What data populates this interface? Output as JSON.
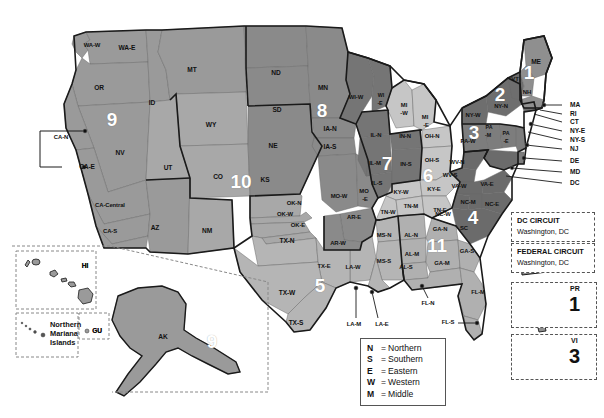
{
  "map": {
    "title": "United States Federal Judicial Circuits and District Courts",
    "background_color": "#ffffff",
    "outline_color": "#1a1a1a",
    "shades": {
      "circuit_1": "#8f8f8f",
      "circuit_2": "#6e6e6e",
      "circuit_3": "#7d7d7d",
      "circuit_4": "#6b6b6b",
      "circuit_5": "#b5b5b5",
      "circuit_6": "#c6c6c6",
      "circuit_7": "#757575",
      "circuit_8": "#8a8a8a",
      "circuit_9": "#9a9a9a",
      "circuit_10": "#a8a8a8",
      "circuit_11": "#b0b0b0"
    },
    "circuit_numbers": [
      {
        "label": "1",
        "x": 529,
        "y": 72
      },
      {
        "label": "2",
        "x": 500,
        "y": 94
      },
      {
        "label": "3",
        "x": 474,
        "y": 132
      },
      {
        "label": "4",
        "x": 473,
        "y": 217
      },
      {
        "label": "5",
        "x": 320,
        "y": 285
      },
      {
        "label": "6",
        "x": 428,
        "y": 175
      },
      {
        "label": "7",
        "x": 387,
        "y": 163
      },
      {
        "label": "8",
        "x": 322,
        "y": 110
      },
      {
        "label": "9",
        "x": 112,
        "y": 119
      },
      {
        "label": "9",
        "x": 212,
        "y": 341
      },
      {
        "label": "10",
        "x": 241,
        "y": 181
      },
      {
        "label": "11",
        "x": 437,
        "y": 245
      }
    ],
    "state_labels": [
      {
        "t": "WA-W",
        "x": 92,
        "y": 46,
        "c": "sm"
      },
      {
        "t": "WA-E",
        "x": 127,
        "y": 48,
        "c": ""
      },
      {
        "t": "OR",
        "x": 99,
        "y": 88,
        "c": ""
      },
      {
        "t": "ID",
        "x": 152,
        "y": 103,
        "c": ""
      },
      {
        "t": "MT",
        "x": 192,
        "y": 70,
        "c": ""
      },
      {
        "t": "WY",
        "x": 211,
        "y": 125,
        "c": ""
      },
      {
        "t": "NV",
        "x": 120,
        "y": 153,
        "c": ""
      },
      {
        "t": "UT",
        "x": 168,
        "y": 168,
        "c": ""
      },
      {
        "t": "CO",
        "x": 218,
        "y": 177,
        "c": ""
      },
      {
        "t": "AZ",
        "x": 155,
        "y": 228,
        "c": ""
      },
      {
        "t": "NM",
        "x": 207,
        "y": 231,
        "c": ""
      },
      {
        "t": "ND",
        "x": 276,
        "y": 73,
        "c": ""
      },
      {
        "t": "SD",
        "x": 277,
        "y": 110,
        "c": ""
      },
      {
        "t": "NE",
        "x": 273,
        "y": 146,
        "c": ""
      },
      {
        "t": "KS",
        "x": 265,
        "y": 180,
        "c": ""
      },
      {
        "t": "MN",
        "x": 323,
        "y": 88,
        "c": ""
      },
      {
        "t": "IA-N",
        "x": 330,
        "y": 129,
        "c": ""
      },
      {
        "t": "IA-S",
        "x": 330,
        "y": 147,
        "c": ""
      },
      {
        "t": "MO-W",
        "x": 339,
        "y": 197,
        "c": "sm"
      },
      {
        "t": "MO",
        "x": 364,
        "y": 192,
        "c": "sm"
      },
      {
        "t": "-E",
        "x": 365,
        "y": 200,
        "c": "sm"
      },
      {
        "t": "OK-N",
        "x": 294,
        "y": 204,
        "c": "sm"
      },
      {
        "t": "OK-W",
        "x": 285,
        "y": 215,
        "c": "sm"
      },
      {
        "t": "OK-E",
        "x": 298,
        "y": 226,
        "c": "sm"
      },
      {
        "t": "AR-E",
        "x": 354,
        "y": 218,
        "c": "sm"
      },
      {
        "t": "AR-W",
        "x": 338,
        "y": 244,
        "c": "sm"
      },
      {
        "t": "TX-N",
        "x": 287,
        "y": 241,
        "c": ""
      },
      {
        "t": "TX-E",
        "x": 324,
        "y": 267,
        "c": "sm"
      },
      {
        "t": "TX-W",
        "x": 287,
        "y": 293,
        "c": ""
      },
      {
        "t": "TX-S",
        "x": 296,
        "y": 323,
        "c": ""
      },
      {
        "t": "LA-W",
        "x": 353,
        "y": 268,
        "c": "sm"
      },
      {
        "t": "LA-M",
        "x": 354,
        "y": 325,
        "c": "sm"
      },
      {
        "t": "LA-E",
        "x": 382,
        "y": 325,
        "c": "sm"
      },
      {
        "t": "MS-N",
        "x": 384,
        "y": 236,
        "c": "sm"
      },
      {
        "t": "MS-S",
        "x": 384,
        "y": 262,
        "c": "sm"
      },
      {
        "t": "WI-W",
        "x": 356,
        "y": 98,
        "c": "sm"
      },
      {
        "t": "WI",
        "x": 381,
        "y": 96,
        "c": "xs"
      },
      {
        "t": "-E",
        "x": 380,
        "y": 104,
        "c": "xs"
      },
      {
        "t": "MI",
        "x": 404,
        "y": 106,
        "c": "sm"
      },
      {
        "t": "-W",
        "x": 404,
        "y": 114,
        "c": "sm"
      },
      {
        "t": "MI",
        "x": 425,
        "y": 118,
        "c": "sm"
      },
      {
        "t": "-E",
        "x": 426,
        "y": 126,
        "c": "sm"
      },
      {
        "t": "IL-N",
        "x": 376,
        "y": 136,
        "c": "sm"
      },
      {
        "t": "IL-M",
        "x": 375,
        "y": 164,
        "c": "sm"
      },
      {
        "t": "IL-S",
        "x": 377,
        "y": 184,
        "c": "sm"
      },
      {
        "t": "IN-N",
        "x": 405,
        "y": 137,
        "c": "sm"
      },
      {
        "t": "IN-S",
        "x": 406,
        "y": 165,
        "c": "sm"
      },
      {
        "t": "OH-N",
        "x": 432,
        "y": 137,
        "c": "sm"
      },
      {
        "t": "OH-S",
        "x": 432,
        "y": 161,
        "c": "sm"
      },
      {
        "t": "KY-W",
        "x": 401,
        "y": 193,
        "c": "sm"
      },
      {
        "t": "KY-E",
        "x": 434,
        "y": 190,
        "c": "sm"
      },
      {
        "t": "TN-M",
        "x": 411,
        "y": 207,
        "c": "sm"
      },
      {
        "t": "TN-W",
        "x": 388,
        "y": 213,
        "c": "sm"
      },
      {
        "t": "TN-E",
        "x": 440,
        "y": 211,
        "c": "sm"
      },
      {
        "t": "AL-N",
        "x": 411,
        "y": 236,
        "c": "sm"
      },
      {
        "t": "AL-M",
        "x": 412,
        "y": 255,
        "c": "sm"
      },
      {
        "t": "AL-S",
        "x": 406,
        "y": 268,
        "c": "sm"
      },
      {
        "t": "GA-N",
        "x": 440,
        "y": 230,
        "c": "sm"
      },
      {
        "t": "GA-M",
        "x": 442,
        "y": 264,
        "c": "sm"
      },
      {
        "t": "GA-S",
        "x": 467,
        "y": 252,
        "c": "sm"
      },
      {
        "t": "FL-N",
        "x": 428,
        "y": 304,
        "c": "sm"
      },
      {
        "t": "FL-M",
        "x": 478,
        "y": 293,
        "c": "sm"
      },
      {
        "t": "FL-S",
        "x": 448,
        "y": 323,
        "c": "sm"
      },
      {
        "t": "SC",
        "x": 464,
        "y": 229,
        "c": "sm"
      },
      {
        "t": "NC-W",
        "x": 443,
        "y": 215,
        "c": "sm"
      },
      {
        "t": "NC-M",
        "x": 468,
        "y": 203,
        "c": "sm"
      },
      {
        "t": "NC-E",
        "x": 492,
        "y": 205,
        "c": "sm"
      },
      {
        "t": "VA-W",
        "x": 459,
        "y": 187,
        "c": "sm"
      },
      {
        "t": "VA-E",
        "x": 487,
        "y": 185,
        "c": "sm"
      },
      {
        "t": "WV-N",
        "x": 457,
        "y": 163,
        "c": "sm"
      },
      {
        "t": "WV-S",
        "x": 450,
        "y": 176,
        "c": "sm"
      },
      {
        "t": "PA-W",
        "x": 468,
        "y": 142,
        "c": "sm"
      },
      {
        "t": "PA",
        "x": 489,
        "y": 128,
        "c": "xs"
      },
      {
        "t": "-M",
        "x": 488,
        "y": 136,
        "c": "xs"
      },
      {
        "t": "PA",
        "x": 506,
        "y": 134,
        "c": "xs"
      },
      {
        "t": "-E",
        "x": 506,
        "y": 142,
        "c": "xs"
      },
      {
        "t": "NY-W",
        "x": 473,
        "y": 116,
        "c": "sm"
      },
      {
        "t": "NY-N",
        "x": 501,
        "y": 107,
        "c": "sm"
      },
      {
        "t": "VT",
        "x": 515,
        "y": 80,
        "c": "sm"
      },
      {
        "t": "NH",
        "x": 527,
        "y": 93,
        "c": "sm"
      },
      {
        "t": "ME",
        "x": 536,
        "y": 62,
        "c": ""
      },
      {
        "t": "CA-N",
        "x": 61,
        "y": 138,
        "c": "sm"
      },
      {
        "t": "CA-E",
        "x": 87,
        "y": 167,
        "c": ""
      },
      {
        "t": "CA-Central",
        "x": 110,
        "y": 206,
        "c": "sm"
      },
      {
        "t": "CA-S",
        "x": 110,
        "y": 232,
        "c": "sm"
      },
      {
        "t": "AK",
        "x": 163,
        "y": 337,
        "c": ""
      },
      {
        "t": "HI",
        "x": 85,
        "y": 266,
        "c": ""
      },
      {
        "t": "GU",
        "x": 97,
        "y": 331,
        "c": ""
      }
    ],
    "coastal_labels": [
      {
        "t": "MA",
        "x": 570,
        "y": 105
      },
      {
        "t": "RI",
        "x": 570,
        "y": 114
      },
      {
        "t": "CT",
        "x": 570,
        "y": 122
      },
      {
        "t": "NY-E",
        "x": 570,
        "y": 131
      },
      {
        "t": "NY-S",
        "x": 570,
        "y": 140
      },
      {
        "t": "NJ",
        "x": 570,
        "y": 149
      },
      {
        "t": "DE",
        "x": 570,
        "y": 161
      },
      {
        "t": "MD",
        "x": 570,
        "y": 172
      },
      {
        "t": "DC",
        "x": 570,
        "y": 183
      }
    ],
    "insets": {
      "northern_mariana_islands": "Northern\nMariana\nIslands",
      "northern_mariana_line1": "Northern",
      "northern_mariana_line2": "Mariana",
      "northern_mariana_line3": "Islands",
      "guam": "GU",
      "hawaii": "HI"
    }
  },
  "legend": {
    "dc_circuit": {
      "title": "DC CIRCUIT",
      "location": "Washington, DC"
    },
    "federal_circuit": {
      "title": "FEDERAL CIRCUIT",
      "location": "Washington, DC"
    },
    "puerto_rico": {
      "abbr": "PR",
      "circuit": "1"
    },
    "virgin_islands": {
      "abbr": "VI",
      "circuit": "3"
    },
    "abbreviations": {
      "title": "",
      "rows": [
        {
          "key": "N",
          "eq": "=",
          "value": "Northern"
        },
        {
          "key": "S",
          "eq": "=",
          "value": "Southern"
        },
        {
          "key": "E",
          "eq": "=",
          "value": "Eastern"
        },
        {
          "key": "W",
          "eq": "=",
          "value": "Western"
        },
        {
          "key": "M",
          "eq": "=",
          "value": "Middle"
        }
      ]
    }
  },
  "chart_data": {
    "type": "map",
    "regions": [
      {
        "circuit": "1",
        "states": [
          "ME",
          "NH",
          "MA",
          "RI",
          "PR"
        ]
      },
      {
        "circuit": "2",
        "states": [
          "VT",
          "NY-N",
          "NY-W",
          "NY-E",
          "NY-S",
          "CT"
        ]
      },
      {
        "circuit": "3",
        "states": [
          "PA-W",
          "PA-M",
          "PA-E",
          "NJ",
          "DE",
          "VI"
        ]
      },
      {
        "circuit": "4",
        "states": [
          "MD",
          "VA-W",
          "VA-E",
          "WV-N",
          "WV-S",
          "NC-W",
          "NC-M",
          "NC-E",
          "SC"
        ]
      },
      {
        "circuit": "5",
        "states": [
          "TX-N",
          "TX-E",
          "TX-W",
          "TX-S",
          "LA-W",
          "LA-M",
          "LA-E",
          "MS-N",
          "MS-S"
        ]
      },
      {
        "circuit": "6",
        "states": [
          "OH-N",
          "OH-S",
          "MI-W",
          "MI-E",
          "KY-W",
          "KY-E",
          "TN-W",
          "TN-M",
          "TN-E"
        ]
      },
      {
        "circuit": "7",
        "states": [
          "IL-N",
          "IL-M",
          "IL-S",
          "IN-N",
          "IN-S",
          "WI-W",
          "WI-E"
        ]
      },
      {
        "circuit": "8",
        "states": [
          "ND",
          "SD",
          "MN",
          "IA-N",
          "IA-S",
          "NE",
          "MO-W",
          "MO-E",
          "AR-W",
          "AR-E"
        ]
      },
      {
        "circuit": "9",
        "states": [
          "WA-W",
          "WA-E",
          "OR",
          "ID",
          "MT",
          "NV",
          "CA-N",
          "CA-E",
          "CA-Central",
          "CA-S",
          "AZ",
          "AK",
          "HI",
          "GU",
          "Northern Mariana Islands"
        ]
      },
      {
        "circuit": "10",
        "states": [
          "WY",
          "UT",
          "CO",
          "KS",
          "NM",
          "OK-N",
          "OK-W",
          "OK-E"
        ]
      },
      {
        "circuit": "11",
        "states": [
          "AL-N",
          "AL-M",
          "AL-S",
          "GA-N",
          "GA-M",
          "GA-S",
          "FL-N",
          "FL-M",
          "FL-S"
        ]
      },
      {
        "circuit": "DC",
        "states": [
          "Washington, DC"
        ]
      },
      {
        "circuit": "Federal",
        "states": [
          "Washington, DC"
        ]
      }
    ]
  }
}
